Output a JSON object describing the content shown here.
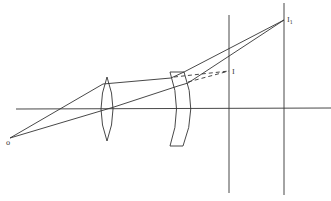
{
  "diagram": {
    "type": "ray-optics",
    "labels": {
      "object": "o",
      "intermediate_image": "I",
      "final_image": "I",
      "final_image_sub": "1"
    },
    "colors": {
      "line": "#333333",
      "background": "#ffffff"
    }
  }
}
